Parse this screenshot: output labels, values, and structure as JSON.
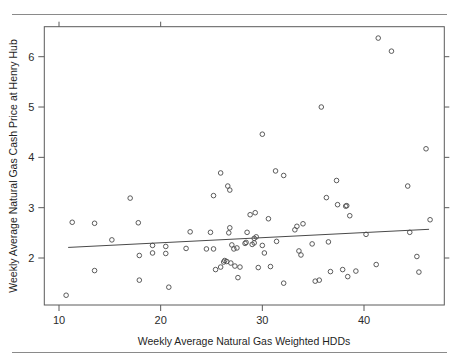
{
  "figure": {
    "accent_color": "#4a4a4a",
    "rule_color": "#8a8a8a",
    "background": "#ffffff"
  },
  "chart_data": {
    "type": "scatter",
    "title": "",
    "xlabel": "Weekly Average Natural Gas Weighted HDDs",
    "ylabel": "Weekly Average Natural Gas Cash Price at Henry Hub",
    "xlim": [
      8.5,
      47.3
    ],
    "ylim": [
      1.07,
      6.63
    ],
    "xticks": [
      10,
      20,
      30,
      40
    ],
    "xtick_labels": [
      "10",
      "20",
      "30",
      "40"
    ],
    "yticks": [
      2,
      3,
      4,
      5,
      6
    ],
    "ytick_labels": [
      "2",
      "3",
      "4",
      "5",
      "6"
    ],
    "grid": false,
    "legend": null,
    "marker": "open-circle",
    "points": [
      [
        10.7,
        1.26
      ],
      [
        11.3,
        2.71
      ],
      [
        13.5,
        2.69
      ],
      [
        13.5,
        1.75
      ],
      [
        15.2,
        2.36
      ],
      [
        17.0,
        3.19
      ],
      [
        17.8,
        2.7
      ],
      [
        17.9,
        2.05
      ],
      [
        17.9,
        1.56
      ],
      [
        19.2,
        2.25
      ],
      [
        19.2,
        2.1
      ],
      [
        20.5,
        2.23
      ],
      [
        20.5,
        2.09
      ],
      [
        20.8,
        1.42
      ],
      [
        22.5,
        2.19
      ],
      [
        22.9,
        2.52
      ],
      [
        24.5,
        2.18
      ],
      [
        24.9,
        2.51
      ],
      [
        25.2,
        3.24
      ],
      [
        25.2,
        2.18
      ],
      [
        25.4,
        1.77
      ],
      [
        25.9,
        3.69
      ],
      [
        25.9,
        1.82
      ],
      [
        26.2,
        1.92
      ],
      [
        26.3,
        1.95
      ],
      [
        26.5,
        1.93
      ],
      [
        26.6,
        3.43
      ],
      [
        26.7,
        2.5
      ],
      [
        26.8,
        3.35
      ],
      [
        26.8,
        2.6
      ],
      [
        26.9,
        1.9
      ],
      [
        27.0,
        2.26
      ],
      [
        27.2,
        2.18
      ],
      [
        27.3,
        1.84
      ],
      [
        27.5,
        2.2
      ],
      [
        27.6,
        1.61
      ],
      [
        27.8,
        1.82
      ],
      [
        28.3,
        2.29
      ],
      [
        28.4,
        2.31
      ],
      [
        28.5,
        2.51
      ],
      [
        28.8,
        2.86
      ],
      [
        29.0,
        2.27
      ],
      [
        29.2,
        2.3
      ],
      [
        29.2,
        2.39
      ],
      [
        29.3,
        2.9
      ],
      [
        29.4,
        2.42
      ],
      [
        29.6,
        1.81
      ],
      [
        30.0,
        4.46
      ],
      [
        30.0,
        2.25
      ],
      [
        30.2,
        2.1
      ],
      [
        30.6,
        2.78
      ],
      [
        30.8,
        1.83
      ],
      [
        31.3,
        3.73
      ],
      [
        31.4,
        2.33
      ],
      [
        32.1,
        3.64
      ],
      [
        32.1,
        1.5
      ],
      [
        33.2,
        2.56
      ],
      [
        33.4,
        2.63
      ],
      [
        33.6,
        2.14
      ],
      [
        33.8,
        2.06
      ],
      [
        34.0,
        2.68
      ],
      [
        34.9,
        2.28
      ],
      [
        35.2,
        1.54
      ],
      [
        35.6,
        1.56
      ],
      [
        35.8,
        5.0
      ],
      [
        36.3,
        3.2
      ],
      [
        36.5,
        2.32
      ],
      [
        36.7,
        1.73
      ],
      [
        37.3,
        3.54
      ],
      [
        37.4,
        3.06
      ],
      [
        37.9,
        1.77
      ],
      [
        38.2,
        3.03
      ],
      [
        38.3,
        3.04
      ],
      [
        38.4,
        1.63
      ],
      [
        38.6,
        2.84
      ],
      [
        39.2,
        1.74
      ],
      [
        40.2,
        2.47
      ],
      [
        41.2,
        1.87
      ],
      [
        41.4,
        6.37
      ],
      [
        42.7,
        6.11
      ],
      [
        44.3,
        3.43
      ],
      [
        44.5,
        2.51
      ],
      [
        45.2,
        2.03
      ],
      [
        45.4,
        1.72
      ],
      [
        46.1,
        4.17
      ],
      [
        46.5,
        2.76
      ]
    ],
    "fit_line": {
      "type": "linear-fit",
      "x_start": 10.9,
      "y_start": 2.21,
      "x_end": 46.4,
      "y_end": 2.57
    }
  }
}
